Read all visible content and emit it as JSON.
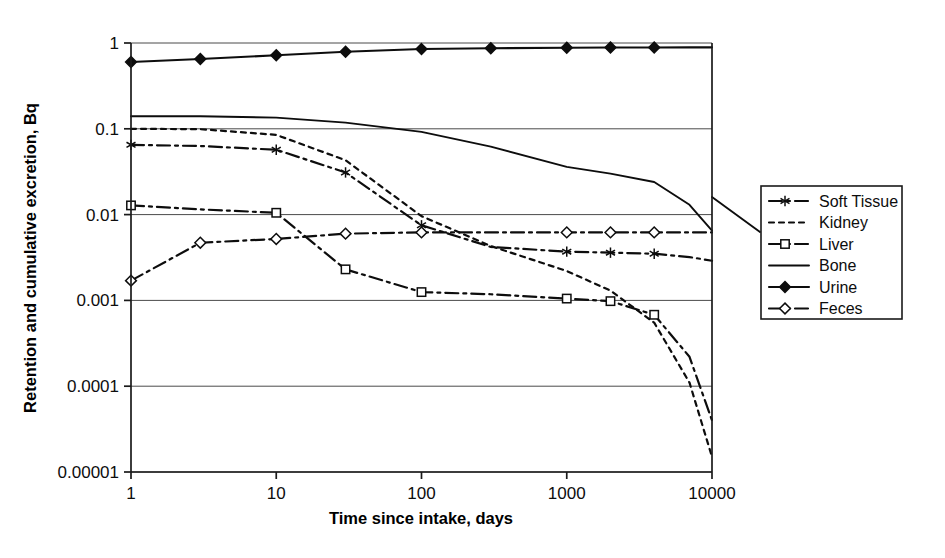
{
  "chart_data": {
    "type": "line",
    "title": "",
    "xlabel": "Time since intake, days",
    "ylabel": "Retention and cumulative excretion, Bq",
    "xscale": "log",
    "yscale": "log",
    "xlim": [
      1,
      10000
    ],
    "ylim": [
      1e-05,
      1
    ],
    "grid": true,
    "legend_position": "right",
    "xticks": [
      "1",
      "10",
      "100",
      "1000",
      "10000"
    ],
    "xtick_values": [
      1,
      10,
      100,
      1000,
      10000
    ],
    "yticks": [
      "1",
      "0.1",
      "0.01",
      "0.001",
      "0.0001",
      "0.00001"
    ],
    "ytick_values": [
      1,
      0.1,
      0.01,
      0.001,
      0.0001,
      1e-05
    ],
    "x": [
      1,
      3,
      10,
      30,
      100,
      300,
      1000,
      2000,
      4000,
      7000,
      10000
    ],
    "series": [
      {
        "name": "Soft Tissue",
        "marker": "asterisk",
        "dash": "dash-dot",
        "marker_x": [
          1,
          10,
          30,
          100,
          1000,
          2000,
          4000
        ],
        "values": [
          0.065,
          0.063,
          0.057,
          0.031,
          0.0075,
          0.0042,
          0.0037,
          0.0036,
          0.0035,
          0.0032,
          0.0029
        ]
      },
      {
        "name": "Kidney",
        "marker": "none",
        "dash": "dotted",
        "marker_x": [],
        "values": [
          0.1,
          0.099,
          0.085,
          0.043,
          0.0096,
          0.0043,
          0.0022,
          0.0013,
          0.00055,
          0.00011,
          1.5e-05
        ]
      },
      {
        "name": "Liver",
        "marker": "square",
        "dash": "dash-dot",
        "marker_x": [
          1,
          10,
          30,
          100,
          1000,
          2000,
          4000
        ],
        "values": [
          0.0128,
          0.0115,
          0.0105,
          0.0023,
          0.00125,
          0.00118,
          0.00105,
          0.00098,
          0.00068,
          0.00022,
          4e-05
        ]
      },
      {
        "name": "Bone",
        "marker": "none",
        "dash": "solid",
        "marker_x": [],
        "values": [
          0.14,
          0.14,
          0.135,
          0.118,
          0.092,
          0.062,
          0.036,
          0.03,
          0.024,
          0.013,
          0.0065
        ]
      },
      {
        "name": "Urine",
        "marker": "diamond-filled",
        "dash": "solid",
        "marker_x": [
          1,
          3,
          10,
          30,
          100,
          300,
          1000,
          2000,
          4000
        ],
        "values": [
          0.6,
          0.65,
          0.72,
          0.79,
          0.85,
          0.87,
          0.88,
          0.885,
          0.888,
          0.89,
          0.89
        ]
      },
      {
        "name": "Feces",
        "marker": "diamond-open",
        "dash": "dash-dot",
        "marker_x": [
          1,
          3,
          10,
          30,
          100,
          1000,
          2000,
          4000
        ],
        "values": [
          0.0017,
          0.0047,
          0.0052,
          0.006,
          0.0062,
          0.0062,
          0.0062,
          0.0062,
          0.0062,
          0.0062,
          0.0062
        ]
      }
    ]
  },
  "axes": {
    "x_title": "Time since intake, days",
    "y_title": "Retention and cumulative excretion, Bq",
    "x_tick_labels": [
      "1",
      "10",
      "100",
      "1000",
      "10000"
    ],
    "y_tick_labels": [
      "1",
      "0.1",
      "0.01",
      "0.001",
      "0.0001",
      "0.00001"
    ]
  },
  "legend": {
    "items": [
      {
        "label": "Soft Tissue",
        "icon": "line-asterisk-dashdot-icon"
      },
      {
        "label": "Kidney",
        "icon": "line-dotted-icon"
      },
      {
        "label": "Liver",
        "icon": "line-square-dashdot-icon"
      },
      {
        "label": "Bone",
        "icon": "line-solid-icon"
      },
      {
        "label": "Urine",
        "icon": "line-diamond-filled-icon"
      },
      {
        "label": "Feces",
        "icon": "line-diamond-open-dashdot-icon"
      }
    ]
  },
  "colors": {
    "ink": "#0d0d0d",
    "grid": "#4a4a4a",
    "background": "#ffffff"
  }
}
